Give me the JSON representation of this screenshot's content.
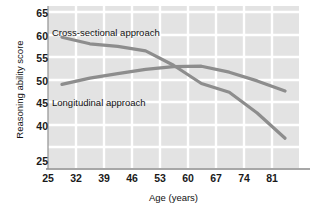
{
  "chart_data": {
    "type": "line",
    "title": "",
    "xlabel": "Age (years)",
    "ylabel": "Reasoning ability score",
    "x": [
      25,
      32,
      39,
      46,
      53,
      60,
      67,
      74,
      81
    ],
    "xtick_labels": [
      "25",
      "32",
      "39",
      "46",
      "53",
      "60",
      "67",
      "74",
      "81"
    ],
    "ytick_labels": [
      "65",
      "60",
      "55",
      "50",
      "45",
      "40",
      "25"
    ],
    "ytick_values": [
      65,
      60,
      55,
      50,
      45,
      40,
      35
    ],
    "ylim": [
      32.5,
      67.5
    ],
    "xlim": [
      21.5,
      84.5
    ],
    "grid": true,
    "legend_position": "inline-annotations",
    "series": [
      {
        "name": "Cross-sectional approach",
        "color": "#8d8d8d",
        "values": [
          59.5,
          58.0,
          57.4,
          56.4,
          53.2,
          49.2,
          47.2,
          42.6,
          37.0
        ]
      },
      {
        "name": "Longitudinal approach",
        "color": "#8d8d8d",
        "values": [
          49.0,
          50.4,
          51.4,
          52.3,
          52.9,
          53.0,
          51.7,
          49.8,
          47.5
        ]
      }
    ],
    "annotations": [
      {
        "name": "cross-sectional-label",
        "text": "Cross-sectional approach",
        "x_px": 52,
        "y_px": 27
      },
      {
        "name": "longitudinal-label",
        "text": "Longitudinal approach",
        "x_px": 52,
        "y_px": 97
      }
    ],
    "colors": {
      "plot_background": "#e3e3e3",
      "gridline": "#ffffff",
      "line": "#8d8d8d",
      "axis": "#8a8a8a",
      "text": "#111111"
    }
  }
}
